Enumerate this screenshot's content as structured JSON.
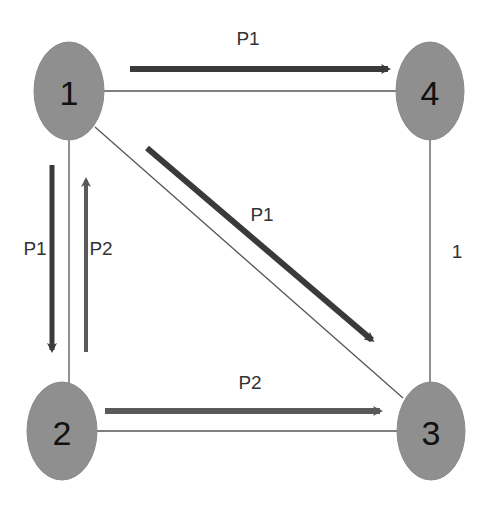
{
  "diagram": {
    "colors": {
      "node_fill": "#8f8f8f",
      "edge": "#555555",
      "flow_p1": "#3a3a3a",
      "flow_p2": "#5a5a5a",
      "label": "#333333"
    },
    "nodes": [
      {
        "id": "1",
        "label": "1"
      },
      {
        "id": "2",
        "label": "2"
      },
      {
        "id": "3",
        "label": "3"
      },
      {
        "id": "4",
        "label": "4"
      }
    ],
    "edges": [
      {
        "from": "1",
        "to": "4"
      },
      {
        "from": "1",
        "to": "2"
      },
      {
        "from": "1",
        "to": "3"
      },
      {
        "from": "2",
        "to": "3"
      },
      {
        "from": "4",
        "to": "3",
        "label": "1"
      }
    ],
    "flows": [
      {
        "path": "P1",
        "from": "1",
        "to": "4",
        "label": "P1"
      },
      {
        "path": "P1",
        "from": "1",
        "to": "3",
        "label": "P1"
      },
      {
        "path": "P1",
        "from": "1",
        "to": "2",
        "label": "P1"
      },
      {
        "path": "P2",
        "from": "2",
        "to": "1",
        "label": "P2"
      },
      {
        "path": "P2",
        "from": "2",
        "to": "3",
        "label": "P2"
      }
    ]
  }
}
